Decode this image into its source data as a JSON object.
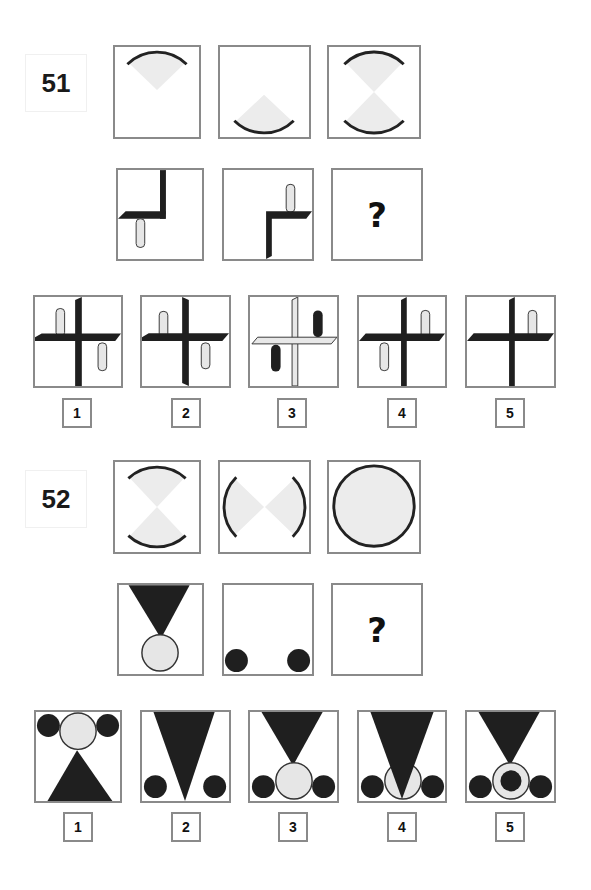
{
  "colors": {
    "dark": "#1f1f1f",
    "light_fill": "#e6e6e6",
    "sector_fill": "#ececec",
    "border": "#8a8a8a"
  },
  "questions": [
    {
      "number": "51",
      "sequence_row_1": [
        "arc-sector-top",
        "arc-sector-bottom",
        "arc-sector-top-and-bottom"
      ],
      "sequence_row_2": [
        "L-shape-top-left-pill-below",
        "L-shape-bottom-right-pill-above",
        "?"
      ],
      "unknown_mark": "?",
      "options": [
        {
          "label": "1",
          "figure": "dark cross, pills top-left up and bottom-right down"
        },
        {
          "label": "2",
          "figure": "dark cross, pills top-left up and bottom-right down (variant)"
        },
        {
          "label": "3",
          "figure": "light cross, dark pills top-right up and bottom-left down"
        },
        {
          "label": "4",
          "figure": "dark cross, pills top-right up and bottom-left down"
        },
        {
          "label": "5",
          "figure": "dark cross, single pill top-right up"
        }
      ]
    },
    {
      "number": "52",
      "sequence_row_1": [
        "arc-sectors-top-bottom",
        "arc-sectors-left-right",
        "full-circle"
      ],
      "sequence_row_2": [
        "triangle-with-light-circle",
        "two-dark-circles",
        "?"
      ],
      "unknown_mark": "?",
      "options": [
        {
          "label": "1",
          "figure": "upright triangle, light circle top, two dark circles"
        },
        {
          "label": "2",
          "figure": "inverted triangle, two dark circles"
        },
        {
          "label": "3",
          "figure": "inverted triangle, light circle, two dark circles"
        },
        {
          "label": "4",
          "figure": "inverted triangle over light circle, two dark circles"
        },
        {
          "label": "5",
          "figure": "inverted triangle, ring with dark center, two dark circles"
        }
      ]
    }
  ]
}
